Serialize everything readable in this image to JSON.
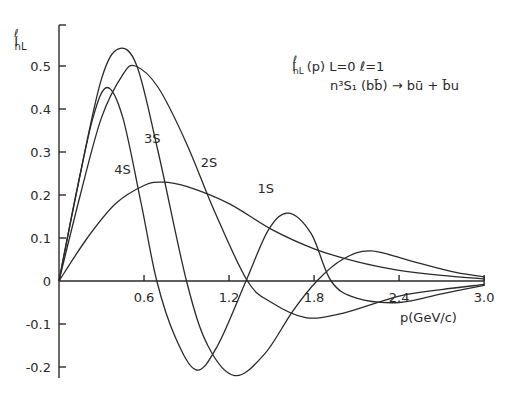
{
  "chart_data": {
    "type": "line",
    "title": "",
    "xlabel": "p(GeV/c)",
    "ylabel": "I^ℓ_nL",
    "xlim": [
      0,
      3.0
    ],
    "ylim": [
      -0.25,
      0.6
    ],
    "x_ticks": [
      0.6,
      1.2,
      1.8,
      2.4,
      3.0
    ],
    "x_tick_labels": [
      "0.6",
      "1.2",
      "1.8",
      "2.4",
      "3.0"
    ],
    "y_ticks": [
      -0.2,
      -0.1,
      0,
      0.1,
      0.2,
      0.3,
      0.4,
      0.5
    ],
    "y_tick_labels": [
      "-0.2",
      "-0.1",
      "0",
      "0.1",
      "0.2",
      "0.3",
      "0.4",
      "0.5"
    ],
    "grid": false,
    "legend": "none (curves labeled inline)",
    "annotations": [
      "I^ℓ_nL (p)   L=0   ℓ=1",
      "n³S₁ (bb̄) → bū + b̄u"
    ],
    "series": [
      {
        "name": "1S",
        "x": [
          0,
          0.2,
          0.4,
          0.6,
          0.73,
          0.9,
          1.2,
          1.5,
          1.8,
          2.1,
          2.4,
          2.7,
          3.0
        ],
        "values": [
          0,
          0.1,
          0.18,
          0.222,
          0.23,
          0.22,
          0.18,
          0.12,
          0.075,
          0.045,
          0.025,
          0.013,
          0.005
        ]
      },
      {
        "name": "2S",
        "x": [
          0,
          0.15,
          0.3,
          0.45,
          0.54,
          0.7,
          0.9,
          1.1,
          1.33,
          1.5,
          1.74,
          2.0,
          2.4,
          2.7,
          3.0
        ],
        "values": [
          0,
          0.2,
          0.38,
          0.48,
          0.5,
          0.45,
          0.32,
          0.16,
          0,
          -0.05,
          -0.085,
          -0.075,
          -0.035,
          -0.02,
          -0.008
        ]
      },
      {
        "name": "3S",
        "x": [
          0,
          0.15,
          0.3,
          0.42,
          0.55,
          0.7,
          0.9,
          1.05,
          1.24,
          1.45,
          1.65,
          1.82,
          2.0,
          2.2,
          2.5,
          2.8,
          3.0
        ],
        "values": [
          0,
          0.25,
          0.47,
          0.54,
          0.5,
          0.3,
          0,
          -0.15,
          -0.22,
          -0.17,
          -0.07,
          0,
          0.05,
          0.07,
          0.045,
          0.02,
          0.01
        ]
      },
      {
        "name": "4S",
        "x": [
          0,
          0.12,
          0.24,
          0.34,
          0.45,
          0.58,
          0.69,
          0.82,
          0.97,
          1.12,
          1.32,
          1.48,
          1.62,
          1.78,
          1.92,
          2.1,
          2.4,
          2.7,
          3.0
        ],
        "values": [
          0,
          0.2,
          0.38,
          0.45,
          0.38,
          0.18,
          0,
          -0.13,
          -0.207,
          -0.15,
          0,
          0.12,
          0.158,
          0.11,
          0.0,
          -0.04,
          -0.05,
          -0.03,
          -0.01
        ]
      }
    ],
    "curve_label_positions": {
      "4S": {
        "x": 0.39,
        "y": 0.25
      },
      "3S": {
        "x": 0.6,
        "y": 0.32
      },
      "2S": {
        "x": 1.0,
        "y": 0.265
      },
      "1S": {
        "x": 1.4,
        "y": 0.205
      }
    }
  },
  "labels": {
    "y_axis_title": "I",
    "y_axis_sup": "ℓ",
    "y_axis_sub": "nL",
    "x_axis_title": "p(GeV/c)",
    "annot_line1_main": "I",
    "annot_line1_sup": "ℓ",
    "annot_line1_sub": "nL",
    "annot_line1_rest": "(p)    L=0    ℓ=1",
    "annot_line2": "n³S₁ (bb̄) → bū + b̄u"
  }
}
